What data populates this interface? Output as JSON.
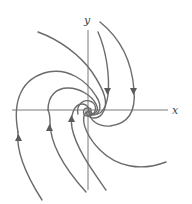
{
  "diagram": {
    "type": "phase-portrait",
    "axes": {
      "x_label": "x",
      "y_label": "y"
    },
    "colors": {
      "curve": "#6b6b6b",
      "axis": "#7a7a7a",
      "background": "#ffffff"
    },
    "trajectory_count": 8,
    "equilibrium": "origin (stable spiral)"
  }
}
